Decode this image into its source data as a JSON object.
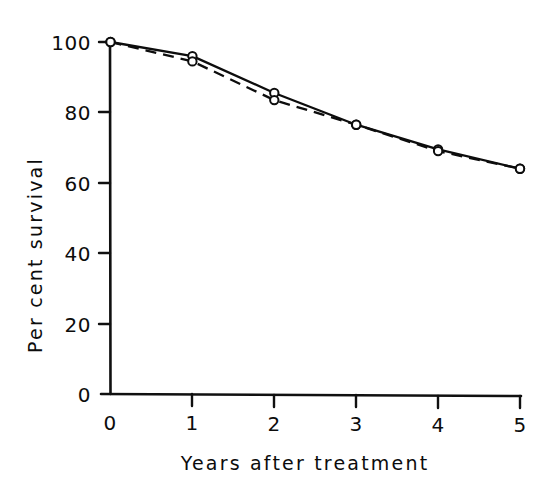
{
  "chart_data": {
    "type": "line",
    "title": "",
    "subtitle": "",
    "xlabel": "Years after treatment",
    "ylabel": "Per cent survival",
    "x": [
      0,
      1,
      2,
      3,
      4,
      5
    ],
    "xtick_labels": [
      "0",
      "1",
      "2",
      "3",
      "4",
      "5"
    ],
    "ytick_labels": [
      "0",
      "20",
      "40",
      "60",
      "80",
      "100"
    ],
    "yticks": [
      0,
      20,
      40,
      60,
      80,
      100
    ],
    "xlim": [
      0,
      5
    ],
    "ylim": [
      0,
      100
    ],
    "grid": false,
    "legend": "none",
    "marker": "open-circle",
    "series": [
      {
        "name": "solid-curve",
        "style": "solid",
        "values": [
          100,
          96,
          85.5,
          76.5,
          69.5,
          64
        ]
      },
      {
        "name": "dashed-curve",
        "style": "dashed",
        "values": [
          100,
          94.5,
          83.5,
          76.5,
          69,
          64
        ]
      }
    ]
  },
  "axes": {
    "y_title": "Per cent survival",
    "x_title": "Years after treatment",
    "y_ticks": [
      {
        "label": "100",
        "value": 100
      },
      {
        "label": "80",
        "value": 80
      },
      {
        "label": "60",
        "value": 60
      },
      {
        "label": "40",
        "value": 40
      },
      {
        "label": "20",
        "value": 20
      },
      {
        "label": "0",
        "value": 0
      }
    ],
    "x_ticks": [
      {
        "label": "0",
        "value": 0
      },
      {
        "label": "1",
        "value": 1
      },
      {
        "label": "2",
        "value": 2
      },
      {
        "label": "3",
        "value": 3
      },
      {
        "label": "4",
        "value": 4
      },
      {
        "label": "5",
        "value": 5
      }
    ]
  },
  "colors": {
    "ink": "#0d0d0d",
    "background": "#ffffff",
    "marker_fill": "#ffffff"
  }
}
